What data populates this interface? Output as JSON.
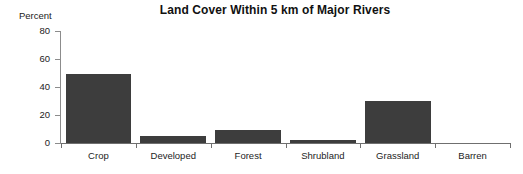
{
  "chart_data": {
    "type": "bar",
    "title": "Land Cover Within 5 km of Major Rivers",
    "xlabel": "",
    "ylabel": "Percent",
    "categories": [
      "Crop",
      "Developed",
      "Forest",
      "Shrubland",
      "Grassland",
      "Barren"
    ],
    "values": [
      49,
      5,
      9,
      2,
      30,
      0
    ],
    "ylim": [
      0,
      80
    ],
    "yticks": [
      0,
      20,
      40,
      60,
      80
    ],
    "ytick_labels": [
      "0",
      "20",
      "40",
      "60",
      "80"
    ],
    "grid": false,
    "legend": null,
    "series": [
      {
        "name": "Percent",
        "values": [
          49,
          5,
          9,
          2,
          30,
          0
        ]
      }
    ],
    "bar_color": "#3d3d3d",
    "axis_color": "#6f6f6f",
    "background": "#ffffff"
  }
}
